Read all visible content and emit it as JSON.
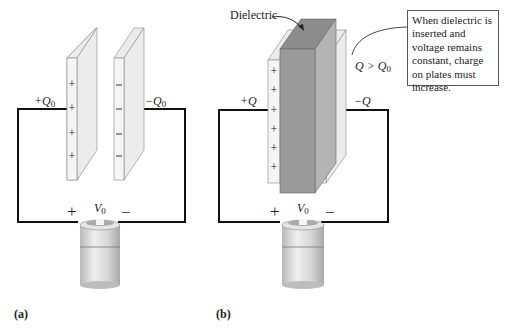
{
  "panel_a": {
    "label": "(a)",
    "plus_charge_label": "+Q",
    "plus_charge_sub": "0",
    "minus_charge_label": "−Q",
    "minus_charge_sub": "0",
    "voltage_label": "V",
    "voltage_sub": "0",
    "battery_plus": "+",
    "battery_minus": "−",
    "plate_plus_count": 4,
    "plate_minus_count": 4
  },
  "panel_b": {
    "label": "(b)",
    "dielectric_label": "Dielectric",
    "plus_charge_label": "+Q",
    "minus_charge_label": "−Q",
    "inequality_label": "Q > Q",
    "inequality_sub": "0",
    "voltage_label": "V",
    "voltage_sub": "0",
    "battery_plus": "+",
    "battery_minus": "−",
    "plate_plus_count": 6,
    "plate_minus_count": 6,
    "callout_text": "When dielectric is inserted and voltage remains constant, charge on plates must increase."
  },
  "colors": {
    "plate_face": "#f2f2f2",
    "plate_side": "#e4e4e4",
    "dielectric_front": "#9a9a9a",
    "dielectric_top": "#8c8c8c",
    "dielectric_side": "#b4b4b4",
    "wire": "#111111",
    "battery_body": "#d8d8d8"
  }
}
